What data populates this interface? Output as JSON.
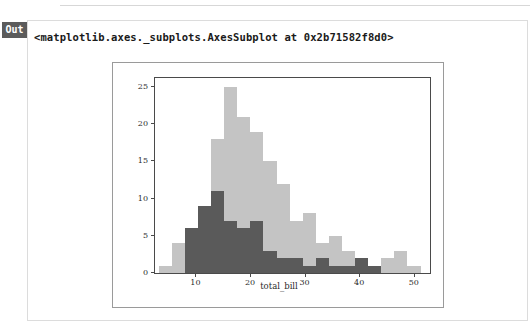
{
  "notebook": {
    "out_badge": "Out",
    "output_text": "<matplotlib.axes._subplots.AxesSubplot at 0x2b71582f8d0>"
  },
  "colors": {
    "light_bar": "#c4c4c4",
    "dark_bar": "#5a5a5a",
    "axes_spine": "#4a4a4a",
    "figure_border": "#9a9a9a",
    "badge_bg": "#5b5b5b"
  },
  "chart_data": {
    "type": "bar",
    "subtype": "histogram",
    "title": "",
    "xlabel": "total_bill",
    "ylabel": "",
    "xlim": [
      2.4,
      52.8
    ],
    "ylim": [
      0,
      26.2
    ],
    "grid": false,
    "legend": null,
    "xticks": [
      10,
      20,
      30,
      40,
      50
    ],
    "yticks": [
      0,
      5,
      10,
      15,
      20,
      25
    ],
    "bin_width": 2.4,
    "bin_starts": [
      3.07,
      5.47,
      7.87,
      10.27,
      12.67,
      15.07,
      17.47,
      19.87,
      22.27,
      24.67,
      27.07,
      29.47,
      31.87,
      34.27,
      36.67,
      39.07,
      41.47,
      43.87,
      46.27,
      48.67
    ],
    "series": [
      {
        "name": "all",
        "color": "#c4c4c4",
        "values": [
          1,
          4,
          6,
          9,
          18,
          25,
          21,
          19,
          15,
          12,
          7,
          8,
          4,
          5,
          3,
          1,
          0,
          2,
          3,
          1
        ]
      },
      {
        "name": "subset",
        "color": "#5a5a5a",
        "values": [
          0,
          0,
          6,
          9,
          11,
          7,
          6,
          7,
          3,
          2,
          2,
          1,
          2,
          1,
          1,
          2,
          1,
          0,
          0,
          0
        ]
      }
    ]
  }
}
